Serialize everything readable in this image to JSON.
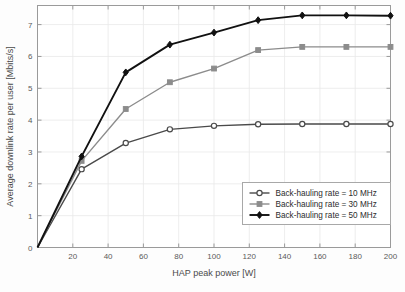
{
  "chart_data": {
    "type": "line",
    "title": "",
    "xlabel": "HAP peak power [W]",
    "ylabel": "Average downlink rate per user [Mbits/s]",
    "xlim": [
      0,
      200
    ],
    "ylim": [
      0,
      7.6
    ],
    "xticks": [
      0,
      20,
      40,
      60,
      80,
      100,
      120,
      140,
      160,
      180,
      200
    ],
    "xticklabels": [
      "0",
      "20",
      "40",
      "60",
      "80",
      "100",
      "120",
      "140",
      "160",
      "180",
      "200"
    ],
    "yticks": [
      0,
      1,
      2,
      3,
      4,
      5,
      6,
      7
    ],
    "yticklabels": [
      "0",
      "1",
      "2",
      "3",
      "4",
      "5",
      "6",
      "7"
    ],
    "grid": true,
    "legend_position": "lower right",
    "x": [
      0,
      25,
      50,
      75,
      100,
      125,
      150,
      175,
      200
    ],
    "series": [
      {
        "name": "Back-hauling rate = 10 MHz",
        "marker": "circle",
        "color": "#4a4a4a",
        "values": [
          0,
          2.46,
          3.28,
          3.71,
          3.82,
          3.87,
          3.88,
          3.88,
          3.88
        ]
      },
      {
        "name": "Back-hauling rate = 30 MHz",
        "marker": "square",
        "color": "#8c8c8c",
        "values": [
          0,
          2.72,
          4.35,
          5.19,
          5.62,
          6.2,
          6.3,
          6.3,
          6.3
        ]
      },
      {
        "name": "Back-hauling rate = 50 MHz",
        "marker": "diamond",
        "color": "#111111",
        "values": [
          0,
          2.86,
          5.5,
          6.37,
          6.75,
          7.14,
          7.29,
          7.29,
          7.28
        ]
      }
    ]
  },
  "legend": {
    "entries": [
      "Back-hauling rate = 10 MHz",
      "Back-hauling rate = 30 MHz",
      "Back-hauling rate = 50 MHz"
    ]
  },
  "colors": {
    "background": "#fdfdfd",
    "axis": "#9a9a9a",
    "grid": "#e8e8e8",
    "text": "#4a4a4a",
    "series_10mhz": "#4a4a4a",
    "series_30mhz": "#8c8c8c",
    "series_50mhz": "#111111"
  }
}
